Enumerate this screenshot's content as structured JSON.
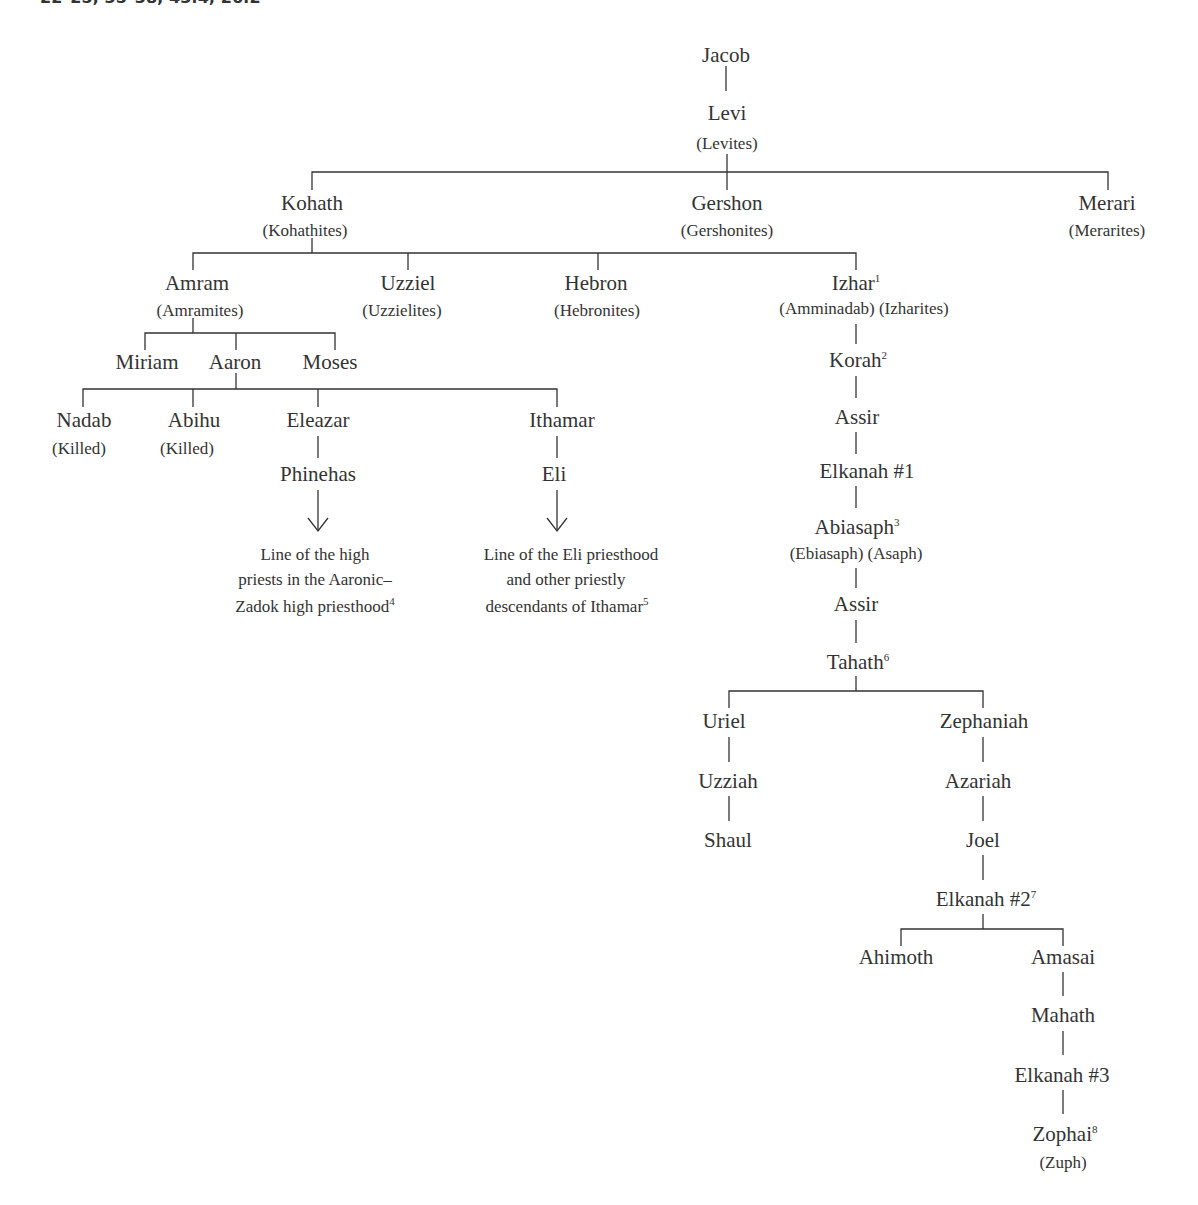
{
  "header": {
    "cut_text": "22–25; 35–38; 43:4; 26:2"
  },
  "diagram": {
    "nodes": {
      "jacob": {
        "name": "Jacob"
      },
      "levi": {
        "name": "Levi",
        "alt": "(Levites)"
      },
      "kohath": {
        "name": "Kohath",
        "alt": "(Kohathites)"
      },
      "gershon": {
        "name": "Gershon",
        "alt": "(Gershonites)"
      },
      "merari": {
        "name": "Merari",
        "alt": "(Merarites)"
      },
      "amram": {
        "name": "Amram",
        "alt": "(Amramites)"
      },
      "uzziel": {
        "name": "Uzziel",
        "alt": "(Uzzielites)"
      },
      "hebron": {
        "name": "Hebron",
        "alt": "(Hebronites)"
      },
      "izhar": {
        "name": "Izhar",
        "sup": "1",
        "alt": "(Amminadab) (Izharites)"
      },
      "miriam": {
        "name": "Miriam"
      },
      "aaron": {
        "name": "Aaron"
      },
      "moses": {
        "name": "Moses"
      },
      "nadab": {
        "name": "Nadab",
        "alt": "(Killed)"
      },
      "abihu": {
        "name": "Abihu",
        "alt": "(Killed)"
      },
      "eleazar": {
        "name": "Eleazar"
      },
      "ithamar": {
        "name": "Ithamar"
      },
      "phinehas": {
        "name": "Phinehas"
      },
      "eli": {
        "name": "Eli"
      },
      "korah": {
        "name": "Korah",
        "sup": "2"
      },
      "assir1": {
        "name": "Assir"
      },
      "elkanah1": {
        "name": "Elkanah #1"
      },
      "abiasaph": {
        "name": "Abiasaph",
        "sup": "3",
        "alt": "(Ebiasaph) (Asaph)"
      },
      "assir2": {
        "name": "Assir"
      },
      "tahath": {
        "name": "Tahath",
        "sup": "6"
      },
      "uriel": {
        "name": "Uriel"
      },
      "uzziah": {
        "name": "Uzziah"
      },
      "shaul": {
        "name": "Shaul"
      },
      "zephaniah": {
        "name": "Zephaniah"
      },
      "azariah": {
        "name": "Azariah"
      },
      "joel": {
        "name": "Joel"
      },
      "elkanah2": {
        "name": "Elkanah #2",
        "sup": "7"
      },
      "ahimoth": {
        "name": "Ahimoth"
      },
      "amasai": {
        "name": "Amasai"
      },
      "mahath": {
        "name": "Mahath"
      },
      "elkanah3": {
        "name": "Elkanah #3"
      },
      "zophai": {
        "name": "Zophai",
        "sup": "8",
        "alt": "(Zuph)"
      }
    },
    "notes": {
      "phinehas_line": {
        "l1": "Line of the high",
        "l2": "priests in the Aaronic–",
        "l3": "Zadok high priesthood",
        "sup": "4"
      },
      "eli_line": {
        "l1": "Line of the Eli priesthood",
        "l2": "and other priestly",
        "l3": "descendants of Ithamar",
        "sup": "5"
      }
    },
    "colors": {
      "ink": "#333333",
      "background": "#ffffff"
    }
  }
}
